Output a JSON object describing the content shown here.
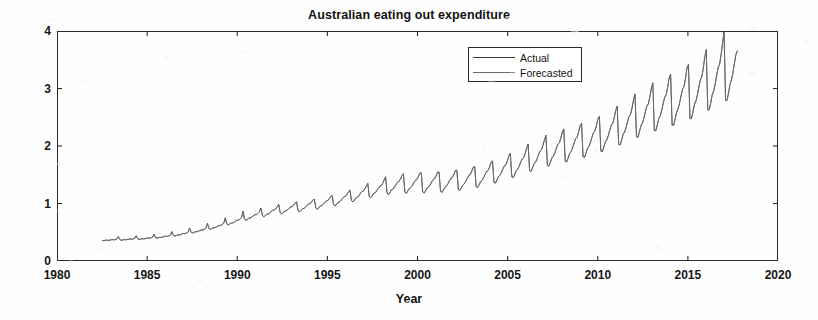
{
  "chart_data": {
    "type": "line",
    "title": "Australian eating out expenditure",
    "xlabel": "Year",
    "ylabel": "Billion $",
    "xlim": [
      1980,
      2020
    ],
    "ylim": [
      0,
      4
    ],
    "xticks": [
      1980,
      1985,
      1990,
      1995,
      2000,
      2005,
      2010,
      2015,
      2020
    ],
    "xtick_labels": [
      "1980",
      "1985",
      "1990",
      "1995",
      "2000",
      "2005",
      "2010",
      "2015",
      "2020"
    ],
    "yticks": [
      0,
      1,
      2,
      3,
      4
    ],
    "ytick_labels": [
      "0",
      "1",
      "2",
      "3",
      "4"
    ],
    "grid": false,
    "legend_position": "upper-center",
    "legend_entries": [
      "Actual",
      "Forecasted"
    ],
    "series": [
      {
        "name": "Actual",
        "color": "#3a3a3a",
        "x_start": 1982.5,
        "x_end": 2017.75,
        "sampling": "monthly",
        "values": [
          0.362,
          0.352,
          0.358,
          0.366,
          0.356,
          0.361,
          0.368,
          0.372,
          0.366,
          0.374,
          0.381,
          0.425,
          0.372,
          0.359,
          0.366,
          0.374,
          0.368,
          0.372,
          0.379,
          0.384,
          0.378,
          0.386,
          0.394,
          0.441,
          0.386,
          0.373,
          0.381,
          0.389,
          0.383,
          0.388,
          0.396,
          0.401,
          0.396,
          0.405,
          0.414,
          0.468,
          0.408,
          0.395,
          0.404,
          0.414,
          0.409,
          0.416,
          0.426,
          0.433,
          0.428,
          0.439,
          0.451,
          0.512,
          0.446,
          0.432,
          0.443,
          0.455,
          0.451,
          0.459,
          0.471,
          0.48,
          0.476,
          0.489,
          0.504,
          0.575,
          0.499,
          0.484,
          0.497,
          0.511,
          0.508,
          0.518,
          0.532,
          0.543,
          0.54,
          0.555,
          0.573,
          0.655,
          0.566,
          0.549,
          0.564,
          0.58,
          0.578,
          0.59,
          0.607,
          0.62,
          0.618,
          0.636,
          0.657,
          0.752,
          0.644,
          0.625,
          0.643,
          0.662,
          0.661,
          0.676,
          0.696,
          0.711,
          0.71,
          0.731,
          0.756,
          0.866,
          0.726,
          0.705,
          0.726,
          0.748,
          0.748,
          0.765,
          0.788,
          0.806,
          0.806,
          0.83,
          0.859,
          0.921,
          0.79,
          0.768,
          0.791,
          0.816,
          0.817,
          0.836,
          0.862,
          0.882,
          0.883,
          0.91,
          0.943,
          0.986,
          0.838,
          0.816,
          0.841,
          0.868,
          0.87,
          0.891,
          0.919,
          0.941,
          0.943,
          0.973,
          1.008,
          1.031,
          0.876,
          0.854,
          0.881,
          0.91,
          0.913,
          0.936,
          0.966,
          0.99,
          0.993,
          1.025,
          1.063,
          1.075,
          0.92,
          0.898,
          0.927,
          0.958,
          0.963,
          0.987,
          1.019,
          1.045,
          1.049,
          1.083,
          1.124,
          1.141,
          0.978,
          0.956,
          0.988,
          1.022,
          1.028,
          1.055,
          1.09,
          1.119,
          1.124,
          1.161,
          1.206,
          1.238,
          1.048,
          1.026,
          1.061,
          1.099,
          1.107,
          1.136,
          1.175,
          1.207,
          1.214,
          1.255,
          1.305,
          1.352,
          1.12,
          1.098,
          1.136,
          1.177,
          1.187,
          1.22,
          1.262,
          1.298,
          1.306,
          1.351,
          1.406,
          1.467,
          1.176,
          1.155,
          1.195,
          1.239,
          1.251,
          1.286,
          1.331,
          1.37,
          1.38,
          1.428,
          1.487,
          1.519,
          1.196,
          1.176,
          1.218,
          1.264,
          1.277,
          1.314,
          1.362,
          1.403,
          1.414,
          1.464,
          1.526,
          1.537,
          1.2,
          1.181,
          1.224,
          1.272,
          1.286,
          1.325,
          1.374,
          1.417,
          1.429,
          1.482,
          1.546,
          1.548,
          1.21,
          1.192,
          1.237,
          1.287,
          1.303,
          1.343,
          1.395,
          1.44,
          1.453,
          1.508,
          1.575,
          1.58,
          1.24,
          1.223,
          1.27,
          1.323,
          1.341,
          1.383,
          1.438,
          1.485,
          1.5,
          1.558,
          1.629,
          1.646,
          1.292,
          1.276,
          1.326,
          1.382,
          1.402,
          1.447,
          1.505,
          1.556,
          1.572,
          1.634,
          1.71,
          1.744,
          1.368,
          1.353,
          1.407,
          1.467,
          1.489,
          1.537,
          1.6,
          1.654,
          1.673,
          1.739,
          1.822,
          1.878,
          1.464,
          1.45,
          1.509,
          1.574,
          1.598,
          1.65,
          1.718,
          1.777,
          1.797,
          1.869,
          1.959,
          2.037,
          1.57,
          1.556,
          1.62,
          1.691,
          1.718,
          1.774,
          1.848,
          1.911,
          1.934,
          2.013,
          2.11,
          2.19,
          1.661,
          1.648,
          1.716,
          1.792,
          1.821,
          1.881,
          1.96,
          2.028,
          2.053,
          2.137,
          2.242,
          2.299,
          1.735,
          1.722,
          1.794,
          1.874,
          1.906,
          1.969,
          2.053,
          2.126,
          2.152,
          2.242,
          2.353,
          2.396,
          1.812,
          1.8,
          1.876,
          1.961,
          1.995,
          2.063,
          2.152,
          2.229,
          2.258,
          2.353,
          2.471,
          2.519,
          1.91,
          1.899,
          1.98,
          2.071,
          2.108,
          2.18,
          2.276,
          2.358,
          2.39,
          2.492,
          2.619,
          2.694,
          2.027,
          2.017,
          2.105,
          2.203,
          2.244,
          2.322,
          2.426,
          2.515,
          2.55,
          2.661,
          2.799,
          2.908,
          2.16,
          2.152,
          2.247,
          2.353,
          2.398,
          2.483,
          2.596,
          2.694,
          2.733,
          2.854,
          3.004,
          3.1,
          2.27,
          2.263,
          2.364,
          2.478,
          2.527,
          2.62,
          2.742,
          2.848,
          2.891,
          3.022,
          3.185,
          3.25,
          2.364,
          2.359,
          2.466,
          2.588,
          2.643,
          2.742,
          2.873,
          2.987,
          3.035,
          3.176,
          3.352,
          3.42,
          2.478,
          2.474,
          2.588,
          2.718,
          2.778,
          2.885,
          3.026,
          3.149,
          3.202,
          3.354,
          3.545,
          3.68,
          2.63,
          2.628,
          2.751,
          2.892,
          2.958,
          3.076,
          3.229,
          3.363,
          3.422,
          3.589,
          3.798,
          3.999,
          2.79,
          2.791,
          2.924,
          3.077,
          3.15,
          3.279,
          3.446,
          3.594,
          3.66
        ]
      },
      {
        "name": "Forecasted",
        "color": "#6a6a6a",
        "x_start": 1982.5,
        "x_end": 2017.75,
        "sampling": "monthly",
        "note": "Nearly coincident with Actual; tracks the same seasonal sawtooth with slightly damped peaks.",
        "values": [
          0.36,
          0.355,
          0.36,
          0.364,
          0.358,
          0.363,
          0.369,
          0.37,
          0.368,
          0.372,
          0.38,
          0.418,
          0.374,
          0.362,
          0.368,
          0.372,
          0.37,
          0.374,
          0.38,
          0.382,
          0.38,
          0.385,
          0.393,
          0.435,
          0.388,
          0.376,
          0.383,
          0.387,
          0.385,
          0.39,
          0.397,
          0.4,
          0.398,
          0.404,
          0.413,
          0.461,
          0.41,
          0.398,
          0.406,
          0.412,
          0.411,
          0.418,
          0.427,
          0.432,
          0.43,
          0.438,
          0.45,
          0.505,
          0.448,
          0.435,
          0.445,
          0.453,
          0.453,
          0.461,
          0.472,
          0.479,
          0.478,
          0.488,
          0.503,
          0.568,
          0.501,
          0.487,
          0.499,
          0.509,
          0.51,
          0.52,
          0.533,
          0.542,
          0.542,
          0.554,
          0.572,
          0.648,
          0.568,
          0.552,
          0.566,
          0.578,
          0.58,
          0.592,
          0.608,
          0.619,
          0.62,
          0.635,
          0.656,
          0.744,
          0.646,
          0.628,
          0.645,
          0.66,
          0.663,
          0.678,
          0.697,
          0.71,
          0.712,
          0.73,
          0.755,
          0.857,
          0.728,
          0.708,
          0.728,
          0.746,
          0.75,
          0.767,
          0.789,
          0.805,
          0.808,
          0.829,
          0.858,
          0.913,
          0.792,
          0.771,
          0.793,
          0.814,
          0.819,
          0.838,
          0.863,
          0.881,
          0.885,
          0.909,
          0.942,
          0.978,
          0.84,
          0.819,
          0.843,
          0.866,
          0.872,
          0.893,
          0.92,
          0.94,
          0.945,
          0.972,
          1.007,
          1.023,
          0.878,
          0.857,
          0.883,
          0.908,
          0.915,
          0.938,
          0.967,
          0.989,
          0.995,
          1.024,
          1.062,
          1.068,
          0.922,
          0.901,
          0.929,
          0.956,
          0.965,
          0.989,
          1.02,
          1.044,
          1.051,
          1.082,
          1.123,
          1.134,
          0.98,
          0.959,
          0.99,
          1.02,
          1.03,
          1.057,
          1.091,
          1.118,
          1.126,
          1.16,
          1.205,
          1.23,
          1.05,
          1.029,
          1.063,
          1.097,
          1.109,
          1.138,
          1.176,
          1.206,
          1.216,
          1.254,
          1.304,
          1.344,
          1.122,
          1.101,
          1.138,
          1.175,
          1.189,
          1.222,
          1.263,
          1.297,
          1.308,
          1.35,
          1.405,
          1.459,
          1.178,
          1.158,
          1.197,
          1.237,
          1.253,
          1.288,
          1.332,
          1.369,
          1.382,
          1.427,
          1.486,
          1.511,
          1.198,
          1.179,
          1.22,
          1.262,
          1.279,
          1.316,
          1.363,
          1.402,
          1.416,
          1.463,
          1.525,
          1.529,
          1.202,
          1.184,
          1.226,
          1.27,
          1.288,
          1.327,
          1.375,
          1.416,
          1.431,
          1.481,
          1.545,
          1.54,
          1.212,
          1.195,
          1.239,
          1.285,
          1.305,
          1.345,
          1.396,
          1.439,
          1.455,
          1.507,
          1.574,
          1.572,
          1.242,
          1.226,
          1.272,
          1.321,
          1.343,
          1.385,
          1.439,
          1.484,
          1.502,
          1.557,
          1.628,
          1.638,
          1.294,
          1.279,
          1.328,
          1.38,
          1.404,
          1.449,
          1.506,
          1.555,
          1.574,
          1.633,
          1.709,
          1.736,
          1.37,
          1.356,
          1.409,
          1.465,
          1.491,
          1.539,
          1.601,
          1.653,
          1.675,
          1.738,
          1.821,
          1.87,
          1.466,
          1.453,
          1.511,
          1.572,
          1.6,
          1.652,
          1.719,
          1.776,
          1.799,
          1.868,
          1.958,
          2.029,
          1.572,
          1.559,
          1.622,
          1.689,
          1.72,
          1.776,
          1.849,
          1.91,
          1.936,
          2.012,
          2.109,
          2.182,
          1.663,
          1.651,
          1.718,
          1.79,
          1.823,
          1.883,
          1.961,
          2.027,
          2.055,
          2.136,
          2.241,
          2.291,
          1.737,
          1.725,
          1.796,
          1.872,
          1.908,
          1.971,
          2.054,
          2.125,
          2.154,
          2.241,
          2.352,
          2.388,
          1.814,
          1.803,
          1.878,
          1.959,
          1.997,
          2.065,
          2.153,
          2.228,
          2.26,
          2.352,
          2.47,
          2.511,
          1.912,
          1.902,
          1.982,
          2.069,
          2.11,
          2.182,
          2.277,
          2.357,
          2.392,
          2.491,
          2.618,
          2.686,
          2.029,
          2.02,
          2.107,
          2.201,
          2.246,
          2.324,
          2.427,
          2.514,
          2.552,
          2.66,
          2.798,
          2.9,
          2.162,
          2.155,
          2.249,
          2.351,
          2.4,
          2.485,
          2.597,
          2.693,
          2.735,
          2.853,
          3.003,
          3.092,
          2.272,
          2.266,
          2.366,
          2.476,
          2.529,
          2.622,
          2.743,
          2.847,
          2.893,
          3.021,
          3.184,
          3.242,
          2.366,
          2.362,
          2.468,
          2.586,
          2.645,
          2.744,
          2.874,
          2.986,
          3.037,
          3.175,
          3.351,
          3.41,
          2.48,
          2.477,
          2.59,
          2.716,
          2.78,
          2.887,
          3.027,
          3.148,
          3.204,
          3.353,
          3.544,
          3.66,
          2.632,
          2.631,
          2.753,
          2.89,
          2.96,
          3.078,
          3.23,
          3.362,
          3.424,
          3.588,
          3.797,
          3.96,
          2.792,
          2.794,
          2.926,
          3.075,
          3.152,
          3.281,
          3.447,
          3.593,
          3.655
        ]
      }
    ]
  },
  "axes": {
    "frame_color": "#2b2b2b",
    "background": "#fefefe"
  }
}
